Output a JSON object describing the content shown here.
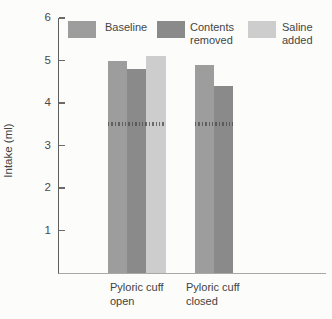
{
  "figure": {
    "background": "#fcfcfa",
    "ylabel": "Intake (ml)",
    "legend": {
      "items": [
        {
          "label": "Baseline",
          "color": "#9d9d9d"
        },
        {
          "label": "Contents\nremoved",
          "color": "#8a8a8a"
        },
        {
          "label": "Saline\nadded",
          "color": "#cdcdcd"
        }
      ]
    },
    "x_groups": [
      {
        "label": "Pyloric cuff\nopen"
      },
      {
        "label": "Pyloric cuff\nclosed"
      }
    ]
  },
  "chart_data": {
    "type": "bar",
    "title": "",
    "ylabel": "Intake (ml)",
    "xlabel": "",
    "ylim": [
      0,
      6
    ],
    "yticks": [
      1,
      2,
      3,
      4,
      5,
      6
    ],
    "grid": false,
    "legend_position": "top",
    "axis_color": "#5e5e5e",
    "categories": [
      "Pyloric cuff open",
      "Pyloric cuff closed"
    ],
    "series": [
      {
        "name": "Baseline",
        "color": "#9d9d9d",
        "values": [
          5.0,
          4.9
        ]
      },
      {
        "name": "Contents removed",
        "color": "#8a8a8a",
        "values": [
          4.8,
          4.4
        ]
      },
      {
        "name": "Saline added",
        "color": "#cdcdcd",
        "values": [
          5.1,
          null
        ]
      }
    ],
    "reference_line": {
      "value": 3.5,
      "style": "dashed-ticks",
      "color": "#4a4a4a"
    }
  }
}
